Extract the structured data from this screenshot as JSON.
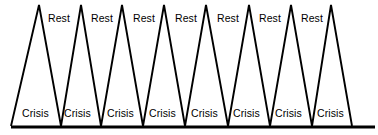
{
  "diagram": {
    "background_color": "#ffffff",
    "line_color": "#000000",
    "baseline_color": "#000000",
    "rest_labels": [
      {
        "text": "Rest",
        "x": 48
      },
      {
        "text": "Rest",
        "x": 91
      },
      {
        "text": "Rest",
        "x": 133
      },
      {
        "text": "Rest",
        "x": 175
      },
      {
        "text": "Rest",
        "x": 217
      },
      {
        "text": "Rest",
        "x": 259
      },
      {
        "text": "Rest",
        "x": 301
      }
    ],
    "crisis_labels": [
      {
        "text": "Crisis",
        "x": 22
      },
      {
        "text": "Crisis",
        "x": 64
      },
      {
        "text": "Crisis",
        "x": 107
      },
      {
        "text": "Crisis",
        "x": 149
      },
      {
        "text": "Crisis",
        "x": 191
      },
      {
        "text": "Crisis",
        "x": 233
      },
      {
        "text": "Crisis",
        "x": 275
      },
      {
        "text": "Crisis",
        "x": 317
      }
    ]
  },
  "chart_data": {
    "type": "line",
    "xlabel": "",
    "ylabel": "",
    "grid": false,
    "legend": "none",
    "xlim": [
      0,
      378
    ],
    "ylim": [
      0,
      135
    ],
    "peak_count": 8,
    "valley_count": 7,
    "peak_apex_y": 5,
    "baseline_y": 126,
    "baseline_x_start": 11,
    "baseline_x_end": 375,
    "series": [
      {
        "name": "crisis-rest-sawtooth",
        "points": [
          [
            11,
            126
          ],
          [
            39,
            5
          ],
          [
            61,
            126
          ],
          [
            81,
            5
          ],
          [
            101,
            126
          ],
          [
            122,
            5
          ],
          [
            143,
            126
          ],
          [
            164,
            5
          ],
          [
            185,
            126
          ],
          [
            206,
            5
          ],
          [
            228,
            126
          ],
          [
            249,
            5
          ],
          [
            270,
            126
          ],
          [
            291,
            5
          ],
          [
            312,
            126
          ],
          [
            331,
            5
          ],
          [
            352,
            126
          ]
        ]
      }
    ],
    "baseline": {
      "x1": 11,
      "y1": 127,
      "x2": 375,
      "y2": 127
    },
    "annotations": [
      {
        "label": "Rest",
        "position": "above-between-peaks",
        "count": 7
      },
      {
        "label": "Crisis",
        "position": "below-near-baseline",
        "count": 8
      }
    ]
  }
}
